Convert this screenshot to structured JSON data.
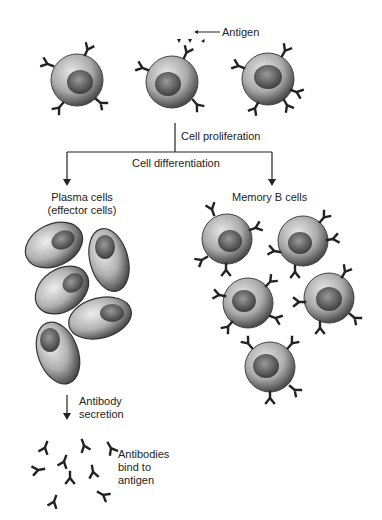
{
  "labels": {
    "antigen": "Antigen",
    "cell_proliferation": "Cell proliferation",
    "cell_differentiation": "Cell differentiation",
    "plasma_cells_line1": "Plasma cells",
    "plasma_cells_line2": "(effector cells)",
    "memory_b_cells": "Memory B cells",
    "antibody_secretion_line1": "Antibody",
    "antibody_secretion_line2": "secretion",
    "antibodies_bind_line1": "Antibodies",
    "antibodies_bind_line2": "bind to",
    "antibodies_bind_line3": "antigen"
  },
  "colors": {
    "line": "#222222",
    "cell_dark": "#555555",
    "cell_light": "#d8d8d8"
  }
}
